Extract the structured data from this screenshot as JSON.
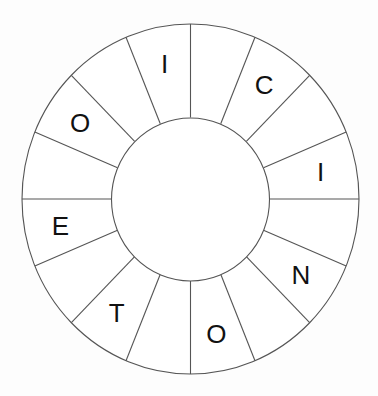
{
  "puzzle": {
    "type": "letter-wheel",
    "segment_count": 16,
    "segments": [
      {
        "index": 0,
        "letter": "I"
      },
      {
        "index": 1,
        "letter": ""
      },
      {
        "index": 2,
        "letter": "O"
      },
      {
        "index": 3,
        "letter": ""
      },
      {
        "index": 4,
        "letter": "E"
      },
      {
        "index": 5,
        "letter": ""
      },
      {
        "index": 6,
        "letter": "T"
      },
      {
        "index": 7,
        "letter": ""
      },
      {
        "index": 8,
        "letter": "O"
      },
      {
        "index": 9,
        "letter": ""
      },
      {
        "index": 10,
        "letter": "N"
      },
      {
        "index": 11,
        "letter": ""
      },
      {
        "index": 12,
        "letter": "I"
      },
      {
        "index": 13,
        "letter": ""
      },
      {
        "index": 14,
        "letter": "C"
      },
      {
        "index": 15,
        "letter": ""
      }
    ],
    "colors": {
      "line": "#555555",
      "letter": "#111111",
      "background": "#ffffff"
    }
  }
}
